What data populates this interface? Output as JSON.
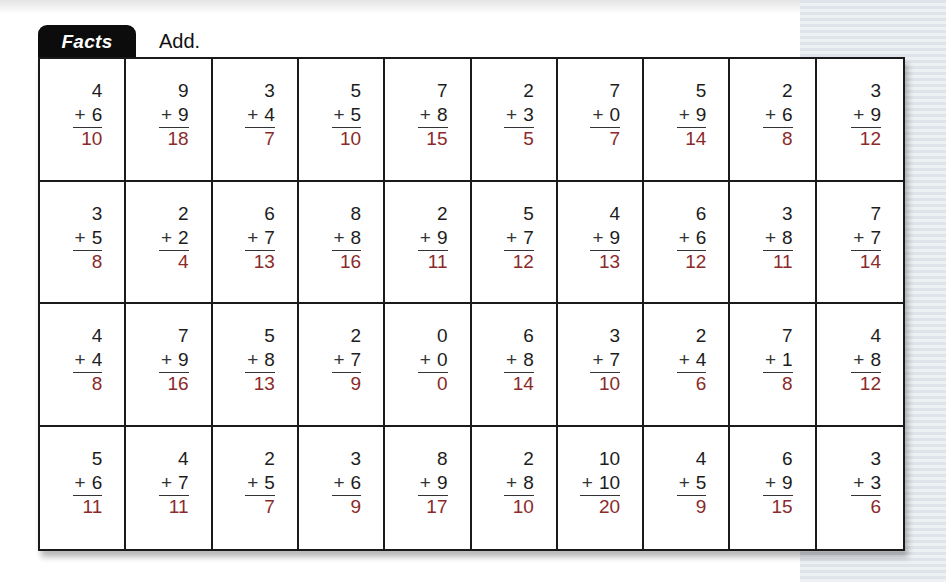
{
  "header": {
    "tab_label": "Facts",
    "instruction": "Add."
  },
  "colors": {
    "answer": "#8b2a2a",
    "tab_bg": "#0c0c0c",
    "grid_line": "#1a1a1a"
  },
  "rows": [
    [
      {
        "a": "4",
        "b": "6",
        "sum": "10"
      },
      {
        "a": "9",
        "b": "9",
        "sum": "18"
      },
      {
        "a": "3",
        "b": "4",
        "sum": "7"
      },
      {
        "a": "5",
        "b": "5",
        "sum": "10"
      },
      {
        "a": "7",
        "b": "8",
        "sum": "15"
      },
      {
        "a": "2",
        "b": "3",
        "sum": "5"
      },
      {
        "a": "7",
        "b": "0",
        "sum": "7"
      },
      {
        "a": "5",
        "b": "9",
        "sum": "14"
      },
      {
        "a": "2",
        "b": "6",
        "sum": "8"
      },
      {
        "a": "3",
        "b": "9",
        "sum": "12"
      }
    ],
    [
      {
        "a": "3",
        "b": "5",
        "sum": "8"
      },
      {
        "a": "2",
        "b": "2",
        "sum": "4"
      },
      {
        "a": "6",
        "b": "7",
        "sum": "13"
      },
      {
        "a": "8",
        "b": "8",
        "sum": "16"
      },
      {
        "a": "2",
        "b": "9",
        "sum": "11"
      },
      {
        "a": "5",
        "b": "7",
        "sum": "12"
      },
      {
        "a": "4",
        "b": "9",
        "sum": "13"
      },
      {
        "a": "6",
        "b": "6",
        "sum": "12"
      },
      {
        "a": "3",
        "b": "8",
        "sum": "11"
      },
      {
        "a": "7",
        "b": "7",
        "sum": "14"
      }
    ],
    [
      {
        "a": "4",
        "b": "4",
        "sum": "8"
      },
      {
        "a": "7",
        "b": "9",
        "sum": "16"
      },
      {
        "a": "5",
        "b": "8",
        "sum": "13"
      },
      {
        "a": "2",
        "b": "7",
        "sum": "9"
      },
      {
        "a": "0",
        "b": "0",
        "sum": "0"
      },
      {
        "a": "6",
        "b": "8",
        "sum": "14"
      },
      {
        "a": "3",
        "b": "7",
        "sum": "10"
      },
      {
        "a": "2",
        "b": "4",
        "sum": "6"
      },
      {
        "a": "7",
        "b": "1",
        "sum": "8"
      },
      {
        "a": "4",
        "b": "8",
        "sum": "12"
      }
    ],
    [
      {
        "a": "5",
        "b": "6",
        "sum": "11"
      },
      {
        "a": "4",
        "b": "7",
        "sum": "11"
      },
      {
        "a": "2",
        "b": "5",
        "sum": "7"
      },
      {
        "a": "3",
        "b": "6",
        "sum": "9"
      },
      {
        "a": "8",
        "b": "9",
        "sum": "17"
      },
      {
        "a": "2",
        "b": "8",
        "sum": "10"
      },
      {
        "a": "10",
        "b": "10",
        "sum": "20"
      },
      {
        "a": "4",
        "b": "5",
        "sum": "9"
      },
      {
        "a": "6",
        "b": "9",
        "sum": "15"
      },
      {
        "a": "3",
        "b": "3",
        "sum": "6"
      }
    ]
  ],
  "operator": "+"
}
